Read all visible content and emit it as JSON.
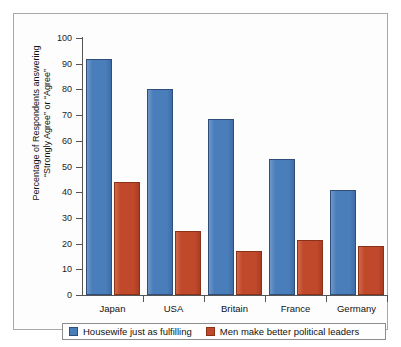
{
  "chart_data": {
    "type": "bar",
    "title": "",
    "subtitle": "",
    "xlabel": "",
    "ylabel": "Percentage of Respondents answering \"Strongly Agree\" or \"Agree\"",
    "ylabel_line1": "Percentage of Respondents answering",
    "ylabel_line2": "“Strongly Agree” or “Agree”",
    "categories": [
      "Japan",
      "USA",
      "Britain",
      "France",
      "Germany"
    ],
    "series": [
      {
        "name": "Housewife just as fulfilling",
        "color": "#4a7ebb",
        "values": [
          92,
          80,
          68.5,
          53,
          41
        ]
      },
      {
        "name": "Men make better political leaders",
        "color": "#c0492b",
        "values": [
          44,
          25,
          17,
          21.5,
          19
        ]
      }
    ],
    "ylim": [
      0,
      100
    ],
    "ytick_values": [
      0,
      10,
      20,
      30,
      40,
      50,
      60,
      70,
      80,
      90,
      100
    ],
    "ytick_labels": [
      "0",
      "10",
      "20",
      "30",
      "40",
      "50",
      "60",
      "70",
      "80",
      "90",
      "100"
    ],
    "grid": false,
    "legend_position": "bottom"
  },
  "legend": {
    "items": [
      {
        "label": "Housewife just as fulfilling",
        "color": "#4a7ebb"
      },
      {
        "label": "Men make better political leaders",
        "color": "#c0492b"
      }
    ]
  }
}
